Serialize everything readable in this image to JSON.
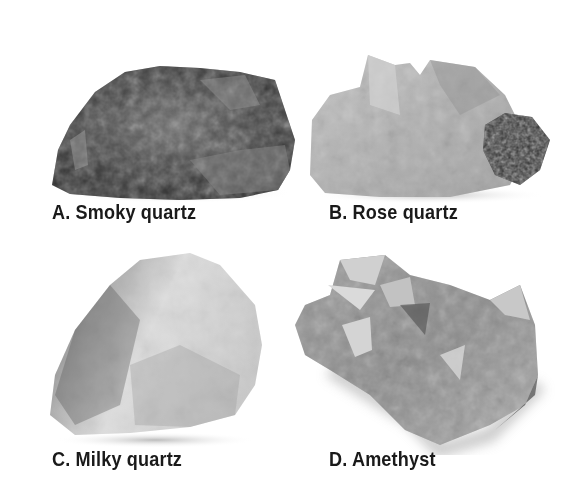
{
  "figure": {
    "specimens": [
      {
        "letter": "A",
        "label": "A. Smoky quartz",
        "tone": "dark"
      },
      {
        "letter": "B",
        "label": "B. Rose quartz",
        "tone": "light-with-dark-cluster"
      },
      {
        "letter": "C",
        "label": "C. Milky quartz",
        "tone": "very-light"
      },
      {
        "letter": "D",
        "label": "D. Amethyst",
        "tone": "crystalline-medium"
      }
    ],
    "colors": {
      "background": "#ffffff",
      "label_text": "#1a1a1a"
    }
  }
}
